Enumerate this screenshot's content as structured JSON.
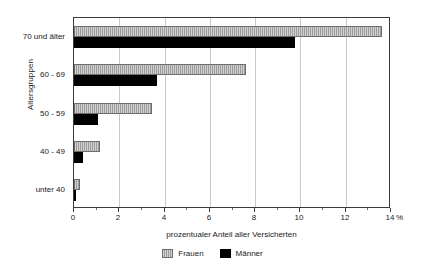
{
  "chart_data": {
    "type": "bar",
    "orientation": "horizontal",
    "title": "",
    "xlabel": "prozentualer Anteil aller Versicherten",
    "ylabel": "Altersgruppen",
    "unit": "%",
    "categories": [
      "unter 40",
      "40 - 49",
      "50 - 59",
      "60 - 69",
      "70 und älter"
    ],
    "series": [
      {
        "name": "Frauen",
        "color": "#9c9c9c",
        "values": [
          0.25,
          1.15,
          3.45,
          7.6,
          13.6
        ]
      },
      {
        "name": "Männer",
        "color": "#000000",
        "values": [
          0.05,
          0.4,
          1.05,
          3.65,
          9.75
        ]
      }
    ],
    "xlim": [
      0,
      14
    ],
    "xticks": [
      0,
      2,
      4,
      6,
      8,
      10,
      12,
      14
    ],
    "xtick_labels": [
      "0",
      "2",
      "4",
      "6",
      "8",
      "10",
      "12",
      "14"
    ],
    "grid": true,
    "legend_position": "bottom-center"
  },
  "axes": {
    "y_title": "Altersgruppen",
    "x_title": "prozentualer Anteil aller Versicherten",
    "x_unit": "%"
  },
  "legend": {
    "items": [
      {
        "label": "Frauen",
        "swatch": "gray-hatched-swatch"
      },
      {
        "label": "Männer",
        "swatch": "black-swatch"
      }
    ]
  }
}
